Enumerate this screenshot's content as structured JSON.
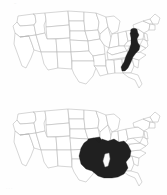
{
  "figure": {
    "name": "two-panel-united-states-choropleth",
    "background_color": "#fefefe",
    "width": 167,
    "height": 195,
    "artifact_top": "~",
    "artifact_bottom": "· ·   ·"
  },
  "style": {
    "outline_color": "#b4b4b4",
    "shaded_color": "#1f1f1f",
    "unshaded_color": "#ffffff",
    "hole_color": "#fbfbfb"
  },
  "maps": [
    {
      "id": "map-top",
      "name": "appalachian-highlight-map",
      "title": "",
      "projection": "contiguous-united-states",
      "shaded_label": "highlighted region",
      "shaded_description": "narrow diagonal band through the central Appalachians",
      "shaded_states": [
        "Pennsylvania",
        "West Virginia",
        "Virginia",
        "Maryland",
        "North Carolina",
        "Tennessee"
      ],
      "unshaded_states": [
        "Washington",
        "Oregon",
        "California",
        "Nevada",
        "Idaho",
        "Montana",
        "Wyoming",
        "Utah",
        "Arizona",
        "Colorado",
        "New Mexico",
        "North Dakota",
        "South Dakota",
        "Nebraska",
        "Kansas",
        "Oklahoma",
        "Texas",
        "Minnesota",
        "Iowa",
        "Missouri",
        "Arkansas",
        "Louisiana",
        "Wisconsin",
        "Illinois",
        "Michigan",
        "Indiana",
        "Ohio",
        "Kentucky",
        "Mississippi",
        "Alabama",
        "Georgia",
        "Florida",
        "South Carolina",
        "New York",
        "Vermont",
        "New Hampshire",
        "Maine",
        "Massachusetts",
        "Rhode Island",
        "Connecticut",
        "New Jersey",
        "Delaware"
      ],
      "shaded_area_extent": {
        "x_min": 121,
        "x_max": 141,
        "y_min": 29,
        "y_max": 72
      }
    },
    {
      "id": "map-bottom",
      "name": "lower-mississippi-valley-highlight-map",
      "title": "",
      "projection": "contiguous-united-states",
      "shaded_label": "highlighted region",
      "shaded_description": "broad block across the lower Mississippi valley and Gulf interior with one unshaded interior pocket",
      "shaded_states": [
        "Arkansas",
        "Louisiana",
        "Mississippi",
        "Alabama",
        "Tennessee",
        "Missouri",
        "Kentucky",
        "East Texas",
        "West Georgia",
        "Southeast Oklahoma"
      ],
      "unshaded_states": [
        "Washington",
        "Oregon",
        "California",
        "Nevada",
        "Idaho",
        "Montana",
        "Wyoming",
        "Utah",
        "Arizona",
        "Colorado",
        "New Mexico",
        "North Dakota",
        "South Dakota",
        "Nebraska",
        "Kansas",
        "Texas",
        "Minnesota",
        "Iowa",
        "Wisconsin",
        "Illinois",
        "Michigan",
        "Indiana",
        "Ohio",
        "Florida",
        "Georgia",
        "South Carolina",
        "North Carolina",
        "Virginia",
        "West Virginia",
        "Pennsylvania",
        "New York",
        "Vermont",
        "New Hampshire",
        "Maine",
        "Massachusetts",
        "Rhode Island",
        "Connecticut",
        "New Jersey",
        "Delaware",
        "Maryland"
      ],
      "interior_hole_label": "unshaded interior pocket",
      "shaded_area_extent": {
        "x_min": 78,
        "x_max": 133,
        "y_min": 137,
        "y_max": 188
      }
    }
  ]
}
